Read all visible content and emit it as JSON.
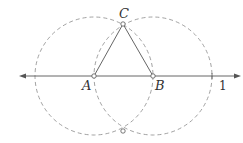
{
  "diagram": {
    "colors": {
      "stroke": "#555555",
      "dashed": "#8a8a8a",
      "point_fill": "#ffffff",
      "text": "#333333"
    },
    "line": {
      "y": 76,
      "x1": 20,
      "x2": 240
    },
    "circles": [
      {
        "name": "circle-centered-A",
        "cx": 94,
        "cy": 76,
        "r": 59
      },
      {
        "name": "circle-centered-B",
        "cx": 153,
        "cy": 76,
        "r": 59
      }
    ],
    "points": [
      {
        "name": "A",
        "x": 94,
        "y": 76
      },
      {
        "name": "B",
        "x": 153,
        "y": 76
      },
      {
        "name": "C",
        "x": 123,
        "y": 24
      },
      {
        "name": "lower-intersection",
        "x": 123,
        "y": 131
      }
    ],
    "labels": {
      "A": "A",
      "B": "B",
      "C": "C",
      "one": "1"
    }
  }
}
